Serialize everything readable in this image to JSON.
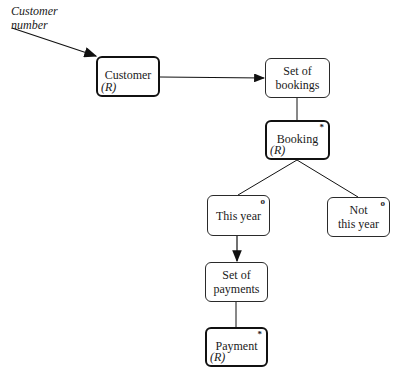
{
  "diagram": {
    "input_label": [
      "Customer",
      "number"
    ],
    "nodes": [
      {
        "id": "customer",
        "label": [
          "Customer"
        ],
        "role": "(R)",
        "marker": "",
        "thick": true
      },
      {
        "id": "set-of-bookings",
        "label": [
          "Set of",
          "bookings"
        ],
        "role": "",
        "marker": "",
        "thick": false
      },
      {
        "id": "booking",
        "label": [
          "Booking"
        ],
        "role": "(R)",
        "marker": "*",
        "thick": true
      },
      {
        "id": "this-year",
        "label": [
          "This year"
        ],
        "role": "",
        "marker": "o",
        "thick": false
      },
      {
        "id": "not-this-year",
        "label": [
          "Not",
          "this year"
        ],
        "role": "",
        "marker": "o",
        "thick": false
      },
      {
        "id": "set-of-payments",
        "label": [
          "Set of",
          "payments"
        ],
        "role": "",
        "marker": "",
        "thick": false
      },
      {
        "id": "payment",
        "label": [
          "Payment"
        ],
        "role": "(R)",
        "marker": "*",
        "thick": true
      }
    ],
    "edges": [
      {
        "from": "input",
        "to": "customer",
        "arrow": true
      },
      {
        "from": "customer",
        "to": "set-of-bookings",
        "arrow": true
      },
      {
        "from": "set-of-bookings",
        "to": "booking",
        "arrow": false
      },
      {
        "from": "booking",
        "to": "this-year",
        "arrow": false
      },
      {
        "from": "booking",
        "to": "not-this-year",
        "arrow": false
      },
      {
        "from": "this-year",
        "to": "set-of-payments",
        "arrow": true
      },
      {
        "from": "set-of-payments",
        "to": "payment",
        "arrow": false
      }
    ]
  }
}
